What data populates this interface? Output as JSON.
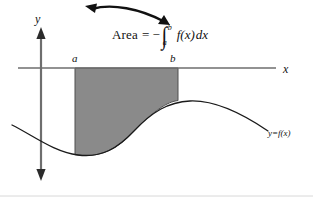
{
  "figure": {
    "kind": "calculus-area-under-curve-diagram",
    "background_color": "#ffffff",
    "labels": {
      "y_axis": "y",
      "x_axis": "x",
      "lower_limit": "a",
      "upper_limit": "b",
      "curve": "y=f(x)"
    },
    "formula": {
      "word": "Area",
      "equals": "=",
      "minus": "−",
      "integral_sign": "∫",
      "upper_limit": "b",
      "lower_limit": "a",
      "integrand": "f(x)",
      "differential": "dx",
      "plain_text": "Area = −∫ₐᵇ f(x)dx"
    },
    "colors": {
      "shaded_region": "#8a8a8a",
      "shaded_region_border": "#4a4a4a",
      "curve": "#1a1a1a",
      "axis": "#6e6e6e",
      "arrow": "#111111",
      "text": "#111111",
      "bottom_rule": "#d8d8d8"
    },
    "geometry": {
      "x_axis_y": 68,
      "x_axis_x1": 18,
      "x_axis_x2": 276,
      "y_axis_x": 41,
      "y_axis_y1": 28,
      "y_axis_y2": 180,
      "a_x": 75,
      "b_x": 178,
      "curve_path": "M 12,125 C 34,136 54,152 78,155 C 102,158 118,148 134,131 C 152,112 168,102 190,101 C 214,100 240,112 268,131",
      "shaded_path": "M 75,68 L 178,68 L 178,100.6 C 168,101.2 152,112 134,131 C 118,148 102,158 78,155 C 77,154.9 76,154.8 75,154.7 Z",
      "callout_arrow_path": "M 88,8 C 110,2 140,8 166,22",
      "callout_arrow_heads": "both"
    },
    "bottom_rule_y": 196
  }
}
